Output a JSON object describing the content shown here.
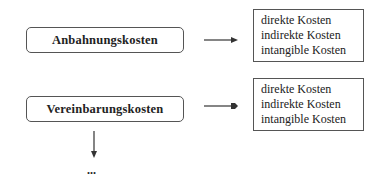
{
  "diagram": {
    "phases": [
      {
        "label": "Anbahnungskosten",
        "costs": [
          "direkte Kosten",
          "indirekte Kosten",
          "intangible Kosten"
        ]
      },
      {
        "label": "Vereinbarungskosten",
        "costs": [
          "direkte Kosten",
          "indirekte Kosten",
          "intangible Kosten"
        ]
      }
    ],
    "continuation": "..."
  }
}
